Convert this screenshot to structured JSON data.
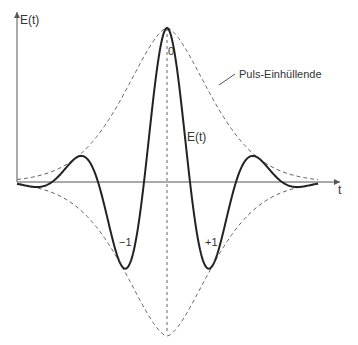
{
  "diagram": {
    "type": "wave-packet",
    "axes": {
      "y_label": "E(t)",
      "x_label": "t"
    },
    "curve_label": "E(t)",
    "envelope_label": "Puls-Einhüllende",
    "extrema_labels": {
      "center": "0",
      "left": "−1",
      "right": "+1"
    },
    "colors": {
      "curve": "#222222",
      "envelope": "#666666",
      "axis": "#555555",
      "text": "#333333"
    }
  }
}
